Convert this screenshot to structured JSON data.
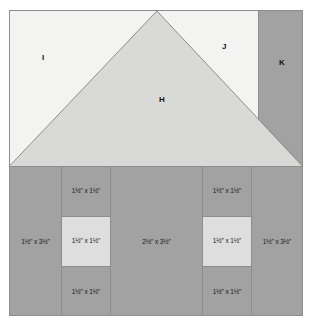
{
  "diagram": {
    "colors": {
      "light": "#f3f3f1",
      "medium_light": "#d9d9d7",
      "medium": "#a2a2a2",
      "cell_light": "#dedede",
      "outline": "#8d8d8d",
      "text": "#141414",
      "background": "#ffffff"
    },
    "roof": {
      "pieces": [
        {
          "id": "piece-i",
          "label": "I",
          "shape": "triangle",
          "shade": "light"
        },
        {
          "id": "piece-h",
          "label": "H",
          "shape": "triangle",
          "shade": "medium_light"
        },
        {
          "id": "piece-j",
          "label": "J",
          "shape": "triangle",
          "shade": "light"
        },
        {
          "id": "piece-k",
          "label": "K",
          "shape": "rectangle",
          "shade": "medium"
        }
      ]
    },
    "wall": {
      "columns": [
        {
          "id": "column-left",
          "cells": [
            {
              "id": "left-strip",
              "label": "1½\" x 3½\"",
              "whole_a": "1",
              "frac_a": "1/2",
              "whole_b": "3",
              "frac_b": "1/2",
              "shade": "medium"
            }
          ]
        },
        {
          "id": "column-inner-left",
          "cells": [
            {
              "id": "inner-left-top",
              "label": "1½\" x 1½\"",
              "whole_a": "1",
              "frac_a": "1/2",
              "whole_b": "1",
              "frac_b": "1/2",
              "shade": "medium"
            },
            {
              "id": "inner-left-middle",
              "label": "1½\" x 1½\"",
              "whole_a": "1",
              "frac_a": "1/2",
              "whole_b": "1",
              "frac_b": "1/2",
              "shade": "cell_light"
            },
            {
              "id": "inner-left-bottom",
              "label": "1½\" x 1½\"",
              "whole_a": "1",
              "frac_a": "1/2",
              "whole_b": "1",
              "frac_b": "1/2",
              "shade": "medium"
            }
          ]
        },
        {
          "id": "column-center",
          "cells": [
            {
              "id": "center-panel",
              "label": "2½\" x 3½\"",
              "whole_a": "2",
              "frac_a": "1/2",
              "whole_b": "3",
              "frac_b": "1/2",
              "shade": "medium"
            }
          ]
        },
        {
          "id": "column-inner-right",
          "cells": [
            {
              "id": "inner-right-top",
              "label": "1½\" x 1½\"",
              "whole_a": "1",
              "frac_a": "1/2",
              "whole_b": "1",
              "frac_b": "1/2",
              "shade": "medium"
            },
            {
              "id": "inner-right-middle",
              "label": "1½\" x 1½\"",
              "whole_a": "1",
              "frac_a": "1/2",
              "whole_b": "1",
              "frac_b": "1/2",
              "shade": "cell_light"
            },
            {
              "id": "inner-right-bottom",
              "label": "1½\" x 1½\"",
              "whole_a": "1",
              "frac_a": "1/2",
              "whole_b": "1",
              "frac_b": "1/2",
              "shade": "medium"
            }
          ]
        },
        {
          "id": "column-right",
          "cells": [
            {
              "id": "right-strip",
              "label": "1½\" x 3½\"",
              "whole_a": "1",
              "frac_a": "1/2",
              "whole_b": "3",
              "frac_b": "1/2",
              "shade": "medium"
            }
          ]
        }
      ]
    },
    "separators": {
      "unit_symbol": "\"",
      "multiply_symbol": "x"
    }
  }
}
